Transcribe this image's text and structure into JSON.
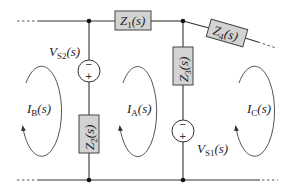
{
  "diagram": {
    "type": "circuit",
    "colors": {
      "wire": "#333333",
      "impedance_fill": "#d3d3d3",
      "impedance_stroke": "#444444",
      "node": "#111111"
    },
    "impedances": {
      "z1": {
        "symbol": "Z",
        "sub": "1",
        "arg": "(s)"
      },
      "z2": {
        "symbol": "Z",
        "sub": "2",
        "arg": "(s)"
      },
      "z3": {
        "symbol": "Z",
        "sub": "3",
        "arg": "(s)"
      },
      "z4": {
        "symbol": "Z",
        "sub": "4",
        "arg": "(s)"
      }
    },
    "sources": {
      "vs1": {
        "symbol": "V",
        "sub": "S1",
        "arg": "(s)",
        "top_sign": "−",
        "bottom_sign": "+"
      },
      "vs2": {
        "symbol": "V",
        "sub": "S2",
        "arg": "(s)",
        "top_sign": "−",
        "bottom_sign": "+"
      }
    },
    "loops": {
      "ib": {
        "symbol": "I",
        "sub": "B",
        "arg": "(s)",
        "direction": "clockwise"
      },
      "ia": {
        "symbol": "I",
        "sub": "A",
        "arg": "(s)",
        "direction": "clockwise"
      },
      "ic": {
        "symbol": "I",
        "sub": "C",
        "arg": "(s)",
        "direction": "clockwise"
      }
    }
  }
}
